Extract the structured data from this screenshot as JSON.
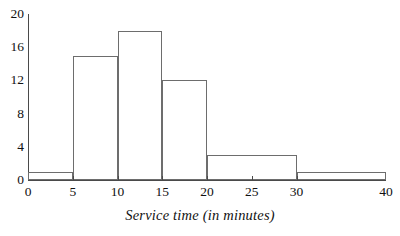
{
  "chart_data": {
    "type": "bar",
    "title": "",
    "xlabel": "Service time (in minutes)",
    "ylabel": "",
    "bin_edges": [
      0,
      5,
      10,
      15,
      20,
      30,
      40
    ],
    "categories": [
      "0-5",
      "5-10",
      "10-15",
      "15-20",
      "20-30",
      "30-40"
    ],
    "values": [
      1,
      15,
      18,
      12,
      3,
      1
    ],
    "bars": [
      {
        "label": "0-5",
        "start": 0,
        "end": 5,
        "value": 1
      },
      {
        "label": "5-10",
        "start": 5,
        "end": 10,
        "value": 15
      },
      {
        "label": "10-15",
        "start": 10,
        "end": 15,
        "value": 18
      },
      {
        "label": "15-20",
        "start": 15,
        "end": 20,
        "value": 12
      },
      {
        "label": "20-30",
        "start": 20,
        "end": 30,
        "value": 3
      },
      {
        "label": "30-40",
        "start": 30,
        "end": 40,
        "value": 1
      }
    ],
    "xlim": [
      0,
      40
    ],
    "ylim": [
      0,
      20
    ],
    "xticks": [
      0,
      5,
      10,
      15,
      20,
      25,
      30,
      40
    ],
    "xtick_labels": [
      "0",
      "5",
      "10",
      "15",
      "20",
      "25",
      "30",
      "40"
    ],
    "yticks": [
      0,
      4,
      8,
      12,
      16,
      20
    ],
    "ytick_labels": [
      "0",
      "4",
      "8",
      "12",
      "16",
      "20"
    ],
    "grid": false,
    "legend": null,
    "bar_fill": "#ffffff",
    "bar_stroke": "#6d6d6d",
    "axis_color": "#4a4a4a",
    "text_color": "#111111"
  }
}
